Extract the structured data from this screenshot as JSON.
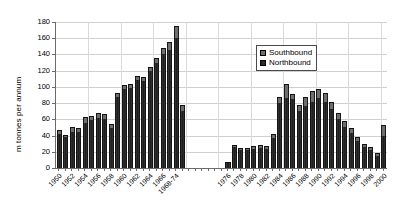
{
  "chart_data": {
    "type": "bar",
    "title": "",
    "subtitle": "",
    "xlabel": "",
    "ylabel": "m tonnes per annum",
    "ylim": [
      0,
      180
    ],
    "yticks": [
      0,
      20,
      40,
      60,
      80,
      100,
      120,
      140,
      160,
      180
    ],
    "grid": true,
    "legend_position": "top-right",
    "stacked": true,
    "categories": [
      "1950",
      "1951",
      "1952",
      "1953",
      "1954",
      "1955",
      "1956",
      "1957",
      "1958",
      "1959",
      "1960",
      "1961",
      "1962",
      "1963",
      "1964",
      "1965",
      "1966",
      "1967",
      "1968",
      "1969",
      "1970",
      "1971",
      "1972",
      "1973",
      "1974",
      "1975",
      "1976",
      "1977",
      "1978",
      "1979",
      "1980",
      "1981",
      "1982",
      "1983",
      "1984",
      "1985",
      "1986",
      "1987",
      "1988",
      "1989",
      "1990",
      "1991",
      "1992",
      "1993",
      "1994",
      "1995",
      "1996",
      "1997",
      "1998",
      "1999",
      "2000"
    ],
    "x_tick_labels": [
      "1950",
      "",
      "1952",
      "",
      "1954",
      "",
      "1956",
      "",
      "1958",
      "",
      "1960",
      "",
      "1962",
      "",
      "1964",
      "",
      "1966",
      "",
      "1968-74",
      "",
      "",
      "",
      "",
      "",
      "",
      "",
      "1976",
      "",
      "1978",
      "",
      "1980",
      "",
      "1982",
      "",
      "1984",
      "",
      "1986",
      "",
      "1988",
      "",
      "1990",
      "",
      "1992",
      "",
      "1994",
      "",
      "1996",
      "",
      "1998",
      "",
      "2000"
    ],
    "series": [
      {
        "name": "Northbound",
        "color": "#2a2a2a",
        "values": [
          42,
          38,
          45,
          44,
          56,
          59,
          62,
          60,
          49,
          88,
          97,
          99,
          108,
          107,
          119,
          130,
          141,
          146,
          160,
          70,
          0,
          0,
          0,
          0,
          0,
          0,
          6,
          26,
          22,
          22,
          24,
          25,
          23,
          37,
          80,
          86,
          85,
          70,
          76,
          81,
          86,
          82,
          73,
          60,
          51,
          43,
          33,
          26,
          22,
          15,
          39
        ]
      },
      {
        "name": "Southbound",
        "color": "#6e6e6e",
        "values": [
          5,
          3,
          6,
          5,
          7,
          5,
          6,
          7,
          5,
          4,
          5,
          5,
          6,
          5,
          6,
          6,
          7,
          9,
          15,
          8,
          0,
          0,
          0,
          0,
          0,
          0,
          1,
          2,
          3,
          3,
          3,
          4,
          4,
          5,
          8,
          17,
          6,
          8,
          12,
          14,
          12,
          10,
          9,
          8,
          7,
          6,
          5,
          4,
          4,
          3,
          14
        ]
      }
    ],
    "missing_data_range": "1970-1975"
  },
  "legend": {
    "items": [
      {
        "label": "Southbound",
        "color": "#6e6e6e"
      },
      {
        "label": "Northbound",
        "color": "#2a2a2a"
      }
    ]
  }
}
